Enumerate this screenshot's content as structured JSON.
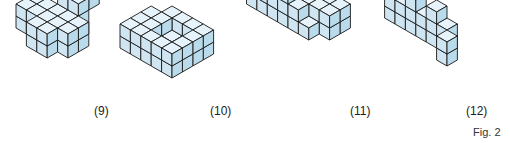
{
  "figure": {
    "caption": "Fig. 2",
    "colors": {
      "top": "#e6f3fa",
      "left": "#cfe6f2",
      "right": "#b9dbec",
      "edge": "#1a1a1a"
    },
    "solids": [
      {
        "label": "(9)",
        "label_pos": [
          96,
          112
        ],
        "origin": [
          68,
          22
        ],
        "size": 12,
        "cubes": [
          [
            0,
            0,
            0
          ],
          [
            0,
            0,
            1
          ],
          [
            1,
            0,
            0
          ],
          [
            1,
            0,
            1
          ],
          [
            0,
            1,
            0
          ],
          [
            0,
            1,
            1
          ],
          [
            1,
            1,
            0
          ],
          [
            1,
            1,
            1
          ],
          [
            -2,
            1,
            0
          ],
          [
            -2,
            1,
            1
          ],
          [
            -1,
            1,
            0
          ],
          [
            -1,
            1,
            1
          ],
          [
            -2,
            2,
            0
          ],
          [
            -2,
            2,
            1
          ],
          [
            -1,
            2,
            0
          ],
          [
            -1,
            2,
            1
          ],
          [
            0,
            2,
            0
          ],
          [
            0,
            2,
            1
          ],
          [
            0,
            3,
            0
          ],
          [
            0,
            3,
            1
          ],
          [
            1,
            2,
            0
          ],
          [
            1,
            2,
            1
          ],
          [
            1,
            3,
            0
          ],
          [
            1,
            3,
            1
          ],
          [
            2,
            1,
            0
          ],
          [
            2,
            1,
            1
          ],
          [
            2,
            2,
            0
          ],
          [
            2,
            2,
            1
          ],
          [
            0,
            -1,
            2
          ],
          [
            1,
            -1,
            2
          ],
          [
            0,
            0,
            2
          ],
          [
            1,
            0,
            2
          ]
        ]
      },
      {
        "label": "(10)",
        "label_pos": [
          212,
          112
        ],
        "origin": [
          172,
          30
        ],
        "size": 12,
        "cubes": [
          [
            0,
            0,
            0
          ],
          [
            0,
            0,
            1
          ],
          [
            1,
            0,
            0
          ],
          [
            1,
            0,
            1
          ],
          [
            2,
            0,
            0
          ],
          [
            2,
            0,
            1
          ],
          [
            3,
            0,
            0
          ],
          [
            3,
            0,
            1
          ],
          [
            0,
            1,
            0
          ],
          [
            0,
            1,
            1
          ],
          [
            3,
            1,
            0
          ],
          [
            3,
            1,
            1
          ],
          [
            0,
            2,
            0
          ],
          [
            0,
            2,
            1
          ],
          [
            3,
            2,
            0
          ],
          [
            3,
            2,
            1
          ],
          [
            0,
            3,
            0
          ],
          [
            0,
            3,
            1
          ],
          [
            1,
            3,
            0
          ],
          [
            1,
            3,
            1
          ],
          [
            2,
            3,
            0
          ],
          [
            2,
            3,
            1
          ],
          [
            3,
            3,
            0
          ],
          [
            3,
            3,
            1
          ],
          [
            1,
            1,
            0
          ],
          [
            2,
            1,
            0
          ],
          [
            1,
            2,
            0
          ],
          [
            2,
            2,
            0
          ],
          [
            -1,
            2,
            0
          ],
          [
            -1,
            2,
            1
          ],
          [
            -1,
            3,
            0
          ],
          [
            -1,
            3,
            1
          ],
          [
            -1,
            1,
            0
          ],
          [
            -1,
            1,
            1
          ]
        ]
      },
      {
        "label": "(11)",
        "label_pos": [
          352,
          112
        ],
        "origin": [
          340,
          22
        ],
        "size": 12,
        "cubes": [
          [
            0,
            0,
            0
          ],
          [
            0,
            0,
            1
          ],
          [
            0,
            1,
            0
          ],
          [
            0,
            1,
            1
          ],
          [
            -1,
            1,
            0
          ],
          [
            -1,
            1,
            1
          ],
          [
            -2,
            1,
            0
          ],
          [
            -2,
            1,
            1
          ],
          [
            -3,
            1,
            0
          ],
          [
            -3,
            1,
            1
          ],
          [
            -4,
            1,
            0
          ],
          [
            -4,
            1,
            1
          ],
          [
            -5,
            1,
            0
          ],
          [
            -5,
            1,
            1
          ],
          [
            -6,
            1,
            0
          ],
          [
            -6,
            1,
            1
          ],
          [
            -1,
            2,
            0
          ],
          [
            -2,
            2,
            0
          ],
          [
            -3,
            2,
            0
          ],
          [
            -4,
            2,
            0
          ],
          [
            -5,
            2,
            0
          ],
          [
            -6,
            2,
            0
          ],
          [
            -6,
            2,
            1
          ],
          [
            -5,
            2,
            1
          ],
          [
            -2,
            2,
            1
          ],
          [
            -3,
            2,
            1
          ],
          [
            -4,
            2,
            1
          ],
          [
            -3,
            2,
            2
          ],
          [
            -1,
            0,
            0
          ],
          [
            -1,
            0,
            1
          ],
          [
            -2,
            0,
            0
          ],
          [
            -2,
            0,
            1
          ]
        ]
      },
      {
        "label": "(12)",
        "label_pos": [
          467,
          98
        ],
        "origin": [
          395,
          12
        ],
        "size": 12,
        "cubes": [
          [
            0,
            0,
            0
          ],
          [
            0,
            0,
            1
          ],
          [
            0,
            0,
            2
          ],
          [
            1,
            0,
            0
          ],
          [
            1,
            0,
            1
          ],
          [
            2,
            0,
            0
          ],
          [
            2,
            0,
            1
          ],
          [
            2,
            0,
            2
          ],
          [
            3,
            0,
            0
          ],
          [
            3,
            0,
            1
          ],
          [
            4,
            0,
            0
          ],
          [
            4,
            0,
            1
          ],
          [
            4,
            0,
            2
          ],
          [
            5,
            0,
            0
          ],
          [
            5,
            0,
            1
          ],
          [
            6,
            1,
            0
          ],
          [
            6,
            1,
            1
          ]
        ]
      }
    ]
  }
}
